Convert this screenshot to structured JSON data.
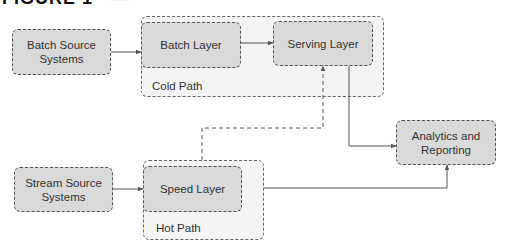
{
  "figure": {
    "title_visible": "FIGURE 1-",
    "title_rest": "—"
  },
  "nodes": {
    "batch_source": {
      "label_line1": "Batch Source",
      "label_line2": "Systems"
    },
    "batch_layer": {
      "label": "Batch Layer"
    },
    "serving_layer": {
      "label": "Serving Layer"
    },
    "analytics": {
      "label_line1": "Analytics and",
      "label_line2": "Reporting"
    },
    "stream_source": {
      "label_line1": "Stream Source",
      "label_line2": "Systems"
    },
    "speed_layer": {
      "label": "Speed Layer"
    }
  },
  "groups": {
    "cold_path": {
      "label": "Cold Path"
    },
    "hot_path": {
      "label": "Hot Path"
    }
  },
  "edges": [
    {
      "from": "Batch Source Systems",
      "to": "Batch Layer",
      "style": "solid"
    },
    {
      "from": "Batch Layer",
      "to": "Serving Layer",
      "style": "solid"
    },
    {
      "from": "Serving Layer",
      "to": "Analytics and Reporting",
      "style": "solid"
    },
    {
      "from": "Stream Source Systems",
      "to": "Speed Layer",
      "style": "solid"
    },
    {
      "from": "Hot Path",
      "to": "Analytics and Reporting",
      "style": "solid"
    },
    {
      "from": "Hot Path",
      "to": "Serving Layer",
      "style": "dashed"
    }
  ],
  "colors": {
    "container_fill": "#f4f4f4",
    "box_fill": "#d9d9d9",
    "border": "#555555",
    "line": "#555555",
    "text": "#333333"
  }
}
